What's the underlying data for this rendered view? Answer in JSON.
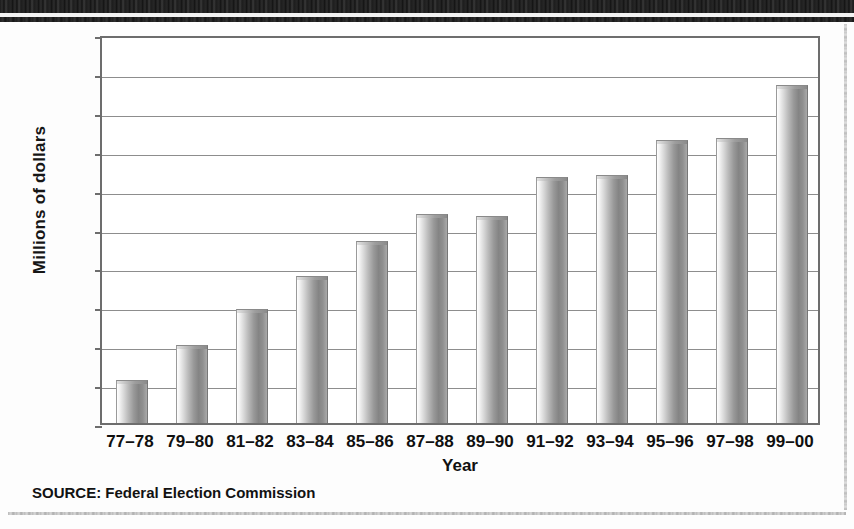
{
  "figure": {
    "source_note": "SOURCE: Federal Election Commission",
    "banner_name": "decorative-header-band"
  },
  "chart_data": {
    "type": "bar",
    "title": "",
    "subtitle": "",
    "xlabel": "Year",
    "ylabel": "Millions of dollars",
    "categories": [
      "77–78",
      "79–80",
      "81–82",
      "83–84",
      "85–86",
      "87–88",
      "89–90",
      "91–92",
      "93–94",
      "95–96",
      "97–98",
      "99–00"
    ],
    "values": [
      33,
      60,
      88,
      113,
      140,
      161,
      160,
      190,
      191,
      218,
      220,
      261
    ],
    "ylim": [
      0,
      300
    ],
    "yticks": [
      0,
      30,
      60,
      90,
      120,
      150,
      180,
      210,
      240,
      270,
      300
    ],
    "ytick_labels": [
      "0",
      "30",
      "60",
      "90",
      "120",
      "150",
      "180",
      "210",
      "240",
      "270",
      "300"
    ],
    "grid": true,
    "legend": "none",
    "bar_color": "#9a9a9a",
    "axis_color": "#6d6d6d",
    "annotations": [
      "SOURCE: Federal Election Commission"
    ]
  }
}
